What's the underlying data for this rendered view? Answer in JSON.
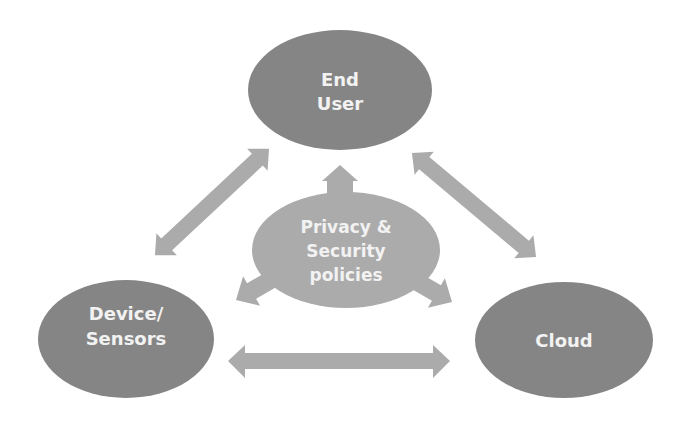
{
  "colors": {
    "background": "#ffffff",
    "node_dark": "#858585",
    "node_light": "#ababab",
    "arrow": "#ababab",
    "text": "#f2f2f2"
  },
  "nodes": {
    "end_user": {
      "line1": "End",
      "line2": "User"
    },
    "device": {
      "line1": "Device/",
      "line2": "Sensors"
    },
    "cloud": {
      "line1": "Cloud"
    },
    "policies": {
      "line1": "Privacy &",
      "line2": "Security",
      "line3": "policies"
    }
  },
  "edges": [
    {
      "from": "end_user",
      "to": "device",
      "type": "bidirectional-arrow"
    },
    {
      "from": "end_user",
      "to": "cloud",
      "type": "bidirectional-arrow"
    },
    {
      "from": "device",
      "to": "cloud",
      "type": "bidirectional-arrow"
    },
    {
      "from": "policies",
      "to": "end_user",
      "type": "arrow"
    },
    {
      "from": "policies",
      "to": "device",
      "type": "arrow"
    },
    {
      "from": "policies",
      "to": "cloud",
      "type": "arrow"
    }
  ]
}
